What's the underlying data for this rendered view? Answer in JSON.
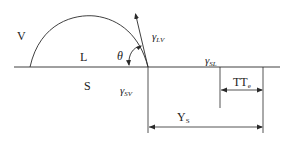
{
  "diagram": {
    "type": "contact-angle / wetting diagram",
    "regions": {
      "vapor": "V",
      "liquid": "L",
      "solid": "S"
    },
    "angle": {
      "symbol": "θ"
    },
    "tensions": {
      "liquid_vapor": {
        "base": "γ",
        "sub": "LV"
      },
      "solid_liquid": {
        "base": "γ",
        "sub": "SL"
      },
      "solid_vapor": {
        "base": "γ",
        "sub": "SV"
      }
    },
    "dimensions": {
      "tte": {
        "base": "TT",
        "sub": "e"
      },
      "ys": {
        "base": "Y",
        "sub": "S"
      }
    },
    "colors": {
      "line": "#2a2a2a",
      "text": "#222222",
      "background": "#ffffff"
    }
  }
}
